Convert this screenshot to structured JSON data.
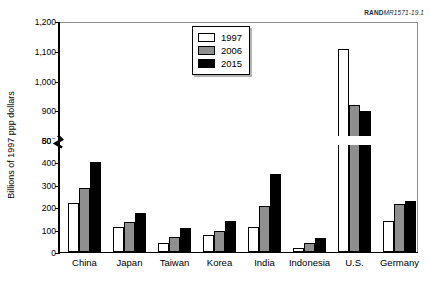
{
  "figure": {
    "id_prefix": "RAND",
    "id_suffix": "MR1571-19.1"
  },
  "chart_data": {
    "type": "bar",
    "title": "",
    "xlabel": "",
    "ylabel": "Billions of 1997 ppp dollars",
    "categories": [
      "China",
      "Japan",
      "Taiwan",
      "Korea",
      "India",
      "Indonesia",
      "U.S.",
      "Germany"
    ],
    "series": [
      {
        "name": "1997",
        "color": "#ffffff",
        "values": [
          220,
          110,
          40,
          75,
          110,
          20,
          1110,
          140
        ]
      },
      {
        "name": "2006",
        "color": "#8f8f8f",
        "values": [
          285,
          135,
          65,
          95,
          205,
          40,
          920,
          215
        ]
      },
      {
        "name": "2015",
        "color": "#000000",
        "values": [
          400,
          175,
          105,
          140,
          350,
          62,
          900,
          228
        ]
      }
    ],
    "ylim": [
      0,
      1200
    ],
    "yticks": [
      0,
      100,
      200,
      300,
      400,
      500,
      800,
      900,
      1000,
      1100,
      1200
    ],
    "ytick_labels": [
      "0",
      "100",
      "200",
      "300",
      "400",
      "500",
      "800",
      "900",
      "1,000",
      "1,100",
      "1,200"
    ],
    "axis_break": {
      "present": true,
      "from": 500,
      "to": 800
    },
    "grid": false,
    "legend_position": "top-center"
  }
}
